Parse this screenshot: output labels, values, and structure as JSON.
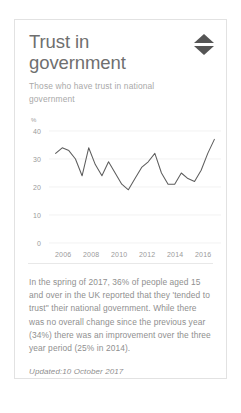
{
  "card": {
    "title": "Trust in government",
    "subtitle": "Those who have trust in national government",
    "sort_icon": "sort-updown-icon",
    "body": "In the spring of 2017, 36% of people aged 15 and over in the UK reported that they 'tended to trust\" their national government. While there was no overall change since the previous year (34%) there was an improvement over the three year period (25% in 2014).",
    "updated": "Updated:10 October 2017"
  },
  "chart_data": {
    "type": "line",
    "title": "Trust in government",
    "subtitle": "Those who have trust in national government",
    "xlabel": "",
    "ylabel": "%",
    "ylim": [
      0,
      40
    ],
    "yticks": [
      0,
      10,
      20,
      30,
      40
    ],
    "xlim": [
      2004.5,
      2017.5
    ],
    "xticks": [
      2006,
      2008,
      2010,
      2012,
      2014,
      2016
    ],
    "grid": true,
    "legend": "none",
    "series": [
      {
        "name": "Trust in national government",
        "x": [
          2005,
          2005.5,
          2006,
          2006.5,
          2007,
          2007.5,
          2008,
          2008.5,
          2009,
          2009.5,
          2010,
          2010.5,
          2011,
          2011.5,
          2012,
          2012.5,
          2013,
          2013.5,
          2014,
          2014.5,
          2015,
          2015.5,
          2016,
          2016.5,
          2017
        ],
        "values": [
          32,
          34,
          33,
          30,
          24,
          34,
          28,
          24,
          29,
          25,
          21,
          19,
          23,
          27,
          29,
          32,
          25,
          21,
          21,
          25,
          23,
          22,
          26,
          32,
          37
        ]
      }
    ],
    "colors": {
      "line": "#5d5d5d",
      "grid": "#ededed",
      "axis_text": "#9a9a9a"
    }
  },
  "scrollbar": {
    "orientation": "horizontal",
    "thumb_color": "#4f4f4f"
  }
}
